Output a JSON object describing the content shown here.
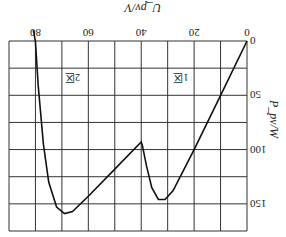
{
  "chart_data": {
    "type": "line",
    "orientation_note_rendered": "rotated 180deg",
    "title": "",
    "xlabel": "U_pv/V",
    "ylabel": "P_pv/W",
    "xlim": [
      0,
      90
    ],
    "ylim": [
      0,
      175
    ],
    "xticks": [
      0,
      20,
      40,
      60,
      80
    ],
    "yticks": [
      0,
      50,
      100,
      150
    ],
    "grid": true,
    "annotations": [
      {
        "text": "1区",
        "x": 25,
        "y": 30
      },
      {
        "text": "2区",
        "x": 66,
        "y": 30
      }
    ],
    "series": [
      {
        "name": "P-U curve",
        "x": [
          0,
          10,
          20,
          28,
          31,
          33.5,
          36,
          38,
          39.6,
          40,
          50,
          60,
          66,
          69,
          72,
          75,
          77,
          79,
          80,
          80.8
        ],
        "y": [
          0,
          50,
          100,
          138,
          146,
          146,
          135,
          115,
          96,
          93,
          118,
          143,
          157,
          159,
          153,
          130,
          95,
          40,
          0,
          -10
        ]
      }
    ]
  }
}
